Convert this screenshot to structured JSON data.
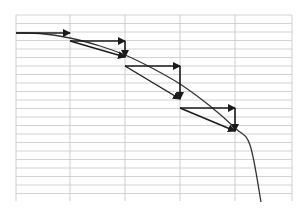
{
  "diagram": {
    "title": "",
    "colors": {
      "background": "#ffffff",
      "grid": "#c8c8c8",
      "curve": "#333333",
      "arrow": "#1a1a1a"
    },
    "grid": {
      "left": 16,
      "right": 292,
      "top": 15,
      "bottom": 201,
      "vertical_lines": [
        16,
        70,
        125,
        180,
        235,
        292
      ],
      "horizontal_spacing": 8.5
    },
    "curve": {
      "name": "exact-solution-curve",
      "points": [
        [
          16,
          33
        ],
        [
          40,
          33.5
        ],
        [
          70,
          38
        ],
        [
          100,
          46
        ],
        [
          125,
          55
        ],
        [
          150,
          67
        ],
        [
          180,
          84
        ],
        [
          210,
          106
        ],
        [
          235,
          128
        ],
        [
          250,
          145
        ],
        [
          261,
          202
        ]
      ]
    },
    "steps": [
      {
        "start": [
          16,
          33
        ],
        "horizontal_end": [
          70,
          33
        ],
        "vertical_end": null
      },
      {
        "start": [
          70,
          41
        ],
        "horizontal_end": [
          125,
          41
        ],
        "vertical_end": [
          125,
          57
        ]
      },
      {
        "start": [
          125,
          66
        ],
        "horizontal_end": [
          180,
          66
        ],
        "vertical_end": [
          180,
          99
        ]
      },
      {
        "start": [
          180,
          108
        ],
        "horizontal_end": [
          235,
          108
        ],
        "vertical_end": [
          235,
          131
        ]
      }
    ]
  }
}
